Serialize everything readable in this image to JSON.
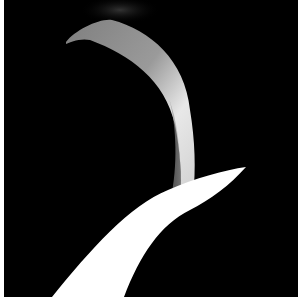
{
  "image": {
    "description": "Abstract photograph of a curved metallic ribbon arcing over a bright white swept shape on a black background",
    "colors": {
      "background": "#000000",
      "border": "#ffffff",
      "ribbon_top": "#8a8a8a",
      "ribbon_highlight": "#e6e6e6",
      "light_beam": "#ffffff"
    }
  }
}
